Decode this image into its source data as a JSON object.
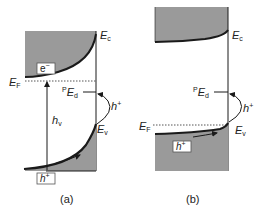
{
  "figure": {
    "panels": [
      {
        "id": "a",
        "caption": "(a)",
        "labels": {
          "conduction_band": "E",
          "conduction_band_sub": "c",
          "fermi_level": "E",
          "fermi_level_sub": "F",
          "defect_level_sup": "P",
          "defect_level": "E",
          "defect_level_sub": "d",
          "valence_band": "E",
          "valence_band_sub": "v",
          "photon": "h",
          "photon_sub": "v",
          "hole_transition": "h",
          "hole_transition_sup": "+",
          "electron_box": "e",
          "electron_box_sup": "−",
          "hole_box": "h",
          "hole_box_sup": "+"
        }
      },
      {
        "id": "b",
        "caption": "(b)",
        "labels": {
          "conduction_band": "E",
          "conduction_band_sub": "c",
          "fermi_level": "E",
          "fermi_level_sub": "F",
          "defect_level_sup": "P",
          "defect_level": "E",
          "defect_level_sub": "d",
          "valence_band": "E",
          "valence_band_sub": "v",
          "hole_transition": "h",
          "hole_transition_sup": "+",
          "hole_box": "h",
          "hole_box_sup": "+"
        }
      }
    ],
    "colors": {
      "band_fill": "#9a9a9a",
      "line": "#1a1a1a",
      "fermi_dotted": "#555555"
    }
  }
}
